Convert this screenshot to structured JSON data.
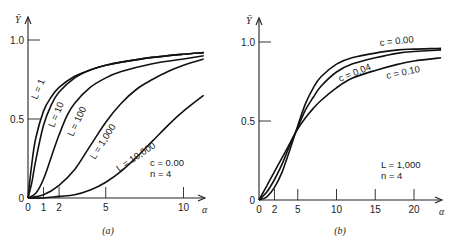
{
  "chart_data": [
    {
      "type": "line",
      "panel_label": "(a)",
      "xlabel": "α",
      "ylabel": "Ȳ",
      "xlim": [
        0,
        11.3
      ],
      "ylim": [
        0,
        1.15
      ],
      "x_ticks": [
        0,
        1,
        2,
        5,
        10
      ],
      "x_tick_labels": [
        "0",
        "1",
        "2",
        "5",
        "10"
      ],
      "y_ticks": [
        0,
        0.5,
        1.0
      ],
      "y_tick_labels": [
        "0",
        "0.5",
        "1.0"
      ],
      "grid": false,
      "annotation": [
        "c = 0.00",
        "n = 4"
      ],
      "series": [
        {
          "name": "L = 1",
          "label_text": "L = 1",
          "x": [
            0,
            0.25,
            0.5,
            1,
            1.5,
            2,
            3,
            4,
            5,
            6,
            8,
            10,
            11.3
          ],
          "y": [
            0,
            0.22,
            0.38,
            0.55,
            0.64,
            0.7,
            0.77,
            0.81,
            0.84,
            0.86,
            0.89,
            0.91,
            0.92
          ]
        },
        {
          "name": "L = 10",
          "label_text": "L = 10",
          "x": [
            0,
            0.25,
            0.5,
            1,
            1.5,
            2,
            3,
            4,
            5,
            6,
            8,
            10,
            11.3
          ],
          "y": [
            0,
            0.1,
            0.24,
            0.46,
            0.59,
            0.67,
            0.76,
            0.81,
            0.84,
            0.86,
            0.89,
            0.91,
            0.92
          ]
        },
        {
          "name": "L = 100",
          "label_text": "L = 100",
          "x": [
            0,
            0.5,
            1,
            1.5,
            2,
            2.5,
            3,
            4,
            5,
            6,
            8,
            10,
            11.3
          ],
          "y": [
            0,
            0.03,
            0.12,
            0.26,
            0.4,
            0.52,
            0.6,
            0.7,
            0.76,
            0.8,
            0.85,
            0.88,
            0.9
          ]
        },
        {
          "name": "L = 1,000",
          "label_text": "L = 1,000",
          "x": [
            0,
            1,
            2,
            3,
            4,
            5,
            6,
            7,
            8,
            9,
            10,
            11.3
          ],
          "y": [
            0,
            0.02,
            0.08,
            0.18,
            0.33,
            0.48,
            0.6,
            0.69,
            0.75,
            0.8,
            0.84,
            0.88
          ]
        },
        {
          "name": "L = 10,000",
          "label_text": "L = 10,000",
          "x": [
            0,
            1,
            2,
            3,
            4,
            5,
            6,
            7,
            8,
            9,
            10,
            11.3
          ],
          "y": [
            0,
            0.0,
            0.01,
            0.02,
            0.05,
            0.1,
            0.17,
            0.26,
            0.36,
            0.46,
            0.55,
            0.65
          ]
        }
      ]
    },
    {
      "type": "line",
      "panel_label": "(b)",
      "xlabel": "α",
      "ylabel": "Ȳ",
      "xlim": [
        0,
        23.5
      ],
      "ylim": [
        0,
        1.15
      ],
      "x_ticks": [
        0,
        2,
        5,
        10,
        15,
        20
      ],
      "x_tick_labels": [
        "0",
        "2",
        "5",
        "10",
        "15",
        "20"
      ],
      "y_ticks": [
        0,
        0.5,
        1.0
      ],
      "y_tick_labels": [
        "0",
        "0.5",
        "1.0"
      ],
      "grid": false,
      "annotation": [
        "L = 1,000",
        "n = 4"
      ],
      "series": [
        {
          "name": "c = 0.00",
          "label_text": "c = 0.00",
          "x": [
            0,
            1,
            2,
            3,
            4,
            5,
            6,
            7,
            8,
            10,
            12,
            15,
            18,
            20,
            23.5
          ],
          "y": [
            0,
            0.02,
            0.08,
            0.18,
            0.32,
            0.47,
            0.61,
            0.71,
            0.78,
            0.86,
            0.9,
            0.93,
            0.95,
            0.955,
            0.96
          ]
        },
        {
          "name": "c = 0.04",
          "label_text": "c = 0.04",
          "x": [
            0,
            1,
            2,
            3,
            4,
            5,
            6,
            7,
            8,
            10,
            12,
            15,
            18,
            20,
            23.5
          ],
          "y": [
            0,
            0.05,
            0.13,
            0.23,
            0.35,
            0.46,
            0.57,
            0.65,
            0.72,
            0.81,
            0.86,
            0.9,
            0.93,
            0.94,
            0.95
          ]
        },
        {
          "name": "c = 0.10",
          "label_text": "c = 0.10",
          "x": [
            0,
            1,
            2,
            3,
            4,
            5,
            6,
            7,
            8,
            10,
            12,
            15,
            18,
            20,
            23.5
          ],
          "y": [
            0,
            0.09,
            0.18,
            0.27,
            0.36,
            0.45,
            0.52,
            0.58,
            0.63,
            0.71,
            0.77,
            0.82,
            0.86,
            0.88,
            0.9
          ]
        }
      ]
    }
  ]
}
